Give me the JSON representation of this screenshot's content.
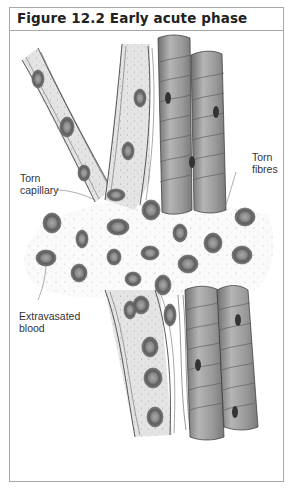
{
  "figure": {
    "title": "Figure 12.2 Early acute phase",
    "labels": {
      "torn_capillary_line1": "Torn",
      "torn_capillary_line2": "capillary",
      "torn_fibres_line1": "Torn",
      "torn_fibres_line2": "fibres",
      "extravasated_line1": "Extravasated",
      "extravasated_line2": "blood"
    },
    "colors": {
      "frame_border": "#a8a8a8",
      "vessel_fill": "#e2e2e2",
      "cell_fill": "#7a7a7a",
      "fibre_fill": "#9a9a9a",
      "text": "#333333"
    }
  }
}
